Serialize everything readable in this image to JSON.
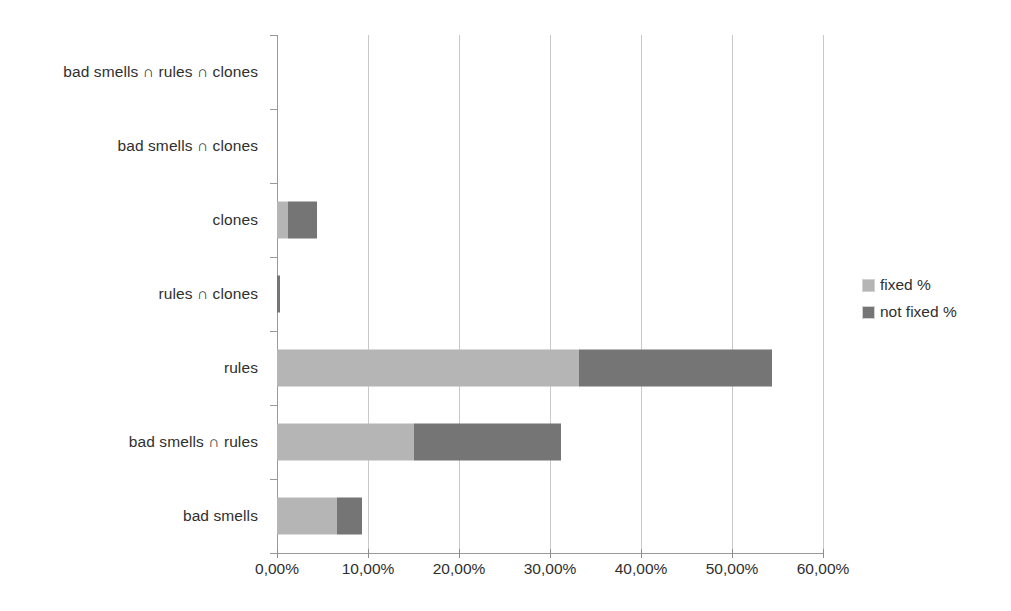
{
  "chart_data": {
    "type": "bar",
    "orientation": "horizontal",
    "stacked": true,
    "title": "",
    "xlabel": "",
    "ylabel": "",
    "xlim": [
      0,
      60
    ],
    "grid": true,
    "legend_position": "right",
    "xticks": [
      0,
      10,
      20,
      30,
      40,
      50,
      60
    ],
    "xtick_labels": [
      "0,00%",
      "10,00%",
      "20,00%",
      "30,00%",
      "40,00%",
      "50,00%",
      "60,00%"
    ],
    "categories": [
      "bad smells ∩ rules ∩ clones",
      "bad smells ∩ clones",
      "clones",
      "rules ∩ clones",
      "rules",
      "bad smells ∩ rules",
      "bad smells"
    ],
    "series": [
      {
        "name": "fixed %",
        "color": "#b5b5b5",
        "values": [
          0.0,
          0.0,
          1.2,
          0.0,
          33.2,
          15.1,
          6.6
        ]
      },
      {
        "name": "not fixed %",
        "color": "#757575",
        "values": [
          0.0,
          0.0,
          3.2,
          0.3,
          21.2,
          16.1,
          2.7
        ]
      }
    ],
    "totals": [
      0.0,
      0.0,
      4.4,
      0.3,
      54.4,
      31.2,
      9.3
    ]
  },
  "legend": {
    "items": [
      {
        "label": "fixed %",
        "color": "#b5b5b5"
      },
      {
        "label": "not fixed %",
        "color": "#757575"
      }
    ]
  }
}
